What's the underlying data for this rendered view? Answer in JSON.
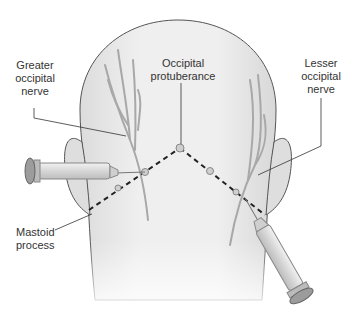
{
  "labels": {
    "greater_occipital_nerve": [
      "Greater",
      "occipital",
      "nerve"
    ],
    "occipital_protuberance": [
      "Occipital",
      "protuberance"
    ],
    "lesser_occipital_nerve": [
      "Lesser",
      "occipital",
      "nerve"
    ],
    "mastoid_process": [
      "Mastoid",
      "process"
    ]
  },
  "colors": {
    "skin": "#ebebeb",
    "outline": "#555555",
    "nerve": "#a8a8a8",
    "dashed_line": "#222222",
    "syringe": "#d8d8d8"
  }
}
